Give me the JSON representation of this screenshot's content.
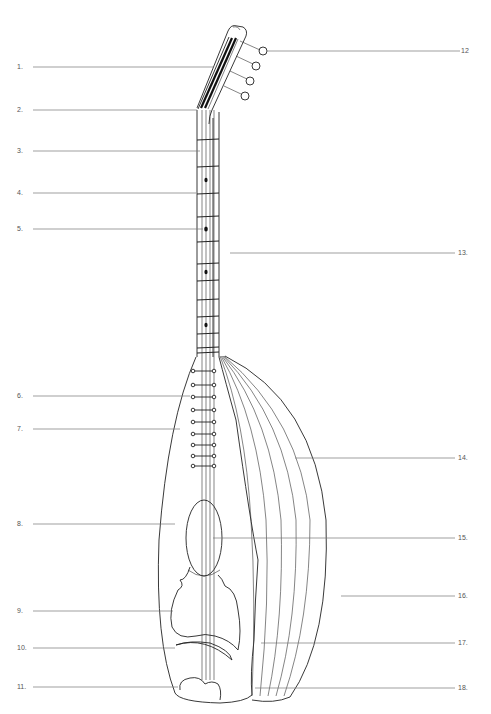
{
  "diagram": {
    "labels_left": [
      {
        "id": "1",
        "text": "1.",
        "y": 67
      },
      {
        "id": "2",
        "text": "2.",
        "y": 110
      },
      {
        "id": "3",
        "text": "3.",
        "y": 151
      },
      {
        "id": "4",
        "text": "4.",
        "y": 193
      },
      {
        "id": "5",
        "text": "5.",
        "y": 229
      },
      {
        "id": "6",
        "text": "6.",
        "y": 396
      },
      {
        "id": "7",
        "text": "7.",
        "y": 429
      },
      {
        "id": "8",
        "text": "8.",
        "y": 524
      },
      {
        "id": "9",
        "text": "9.",
        "y": 611
      },
      {
        "id": "10",
        "text": "10.",
        "y": 648
      },
      {
        "id": "11",
        "text": "11.",
        "y": 687
      }
    ],
    "labels_right": [
      {
        "id": "12",
        "text": "12",
        "y": 51
      },
      {
        "id": "13",
        "text": "13.",
        "y": 253
      },
      {
        "id": "14",
        "text": "14.",
        "y": 458
      },
      {
        "id": "15",
        "text": "15.",
        "y": 538
      },
      {
        "id": "16",
        "text": "16.",
        "y": 596
      },
      {
        "id": "17",
        "text": "17.",
        "y": 643
      },
      {
        "id": "18",
        "text": "18.",
        "y": 688
      }
    ],
    "colors": {
      "ink": "#222222",
      "leader": "#777777",
      "label": "#555555",
      "background": "#ffffff"
    }
  }
}
